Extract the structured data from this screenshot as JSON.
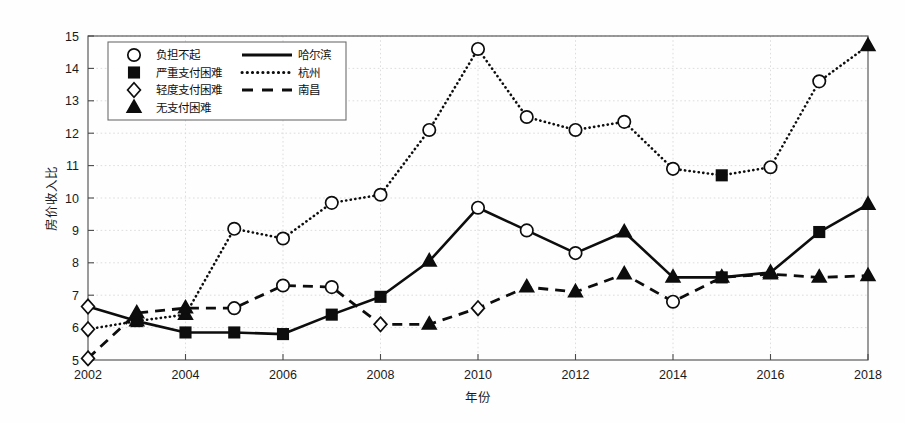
{
  "chart_data": {
    "type": "line",
    "title": "",
    "xlabel": "年份",
    "ylabel": "房价收入比",
    "xlim": [
      2002,
      2018
    ],
    "ylim": [
      5,
      15
    ],
    "x": [
      2002,
      2003,
      2004,
      2005,
      2006,
      2007,
      2008,
      2009,
      2010,
      2011,
      2012,
      2013,
      2014,
      2015,
      2016,
      2017,
      2018
    ],
    "xticks": [
      "2002",
      "2004",
      "2006",
      "2008",
      "2010",
      "2012",
      "2014",
      "2016",
      "2018"
    ],
    "yticks": [
      "5",
      "6",
      "7",
      "8",
      "9",
      "10",
      "11",
      "12",
      "13",
      "14",
      "15"
    ],
    "grid": true,
    "legend_position": "upper-left",
    "series": [
      {
        "name": "哈尔滨",
        "style": "solid",
        "values": [
          6.65,
          6.2,
          5.85,
          5.85,
          5.8,
          6.4,
          6.95,
          8.05,
          9.7,
          9.0,
          8.3,
          8.95,
          7.55,
          7.55,
          7.7,
          8.95,
          9.8
        ],
        "markers": [
          "轻度支付困难",
          "严重支付困难",
          "严重支付困难",
          "严重支付困难",
          "严重支付困难",
          "严重支付困难",
          "严重支付困难",
          "无支付困难",
          "负担不起",
          "负担不起",
          "负担不起",
          "无支付困难",
          "无支付困难",
          "严重支付困难",
          "无支付困难",
          "严重支付困难",
          "无支付困难"
        ]
      },
      {
        "name": "杭州",
        "style": "dotted",
        "values": [
          5.95,
          6.2,
          6.4,
          9.05,
          8.75,
          9.85,
          10.1,
          12.1,
          14.6,
          12.5,
          12.1,
          12.35,
          10.9,
          10.7,
          10.95,
          13.6,
          14.7
        ],
        "markers": [
          "轻度支付困难",
          "无支付困难",
          "无支付困难",
          "负担不起",
          "负担不起",
          "负担不起",
          "负担不起",
          "负担不起",
          "负担不起",
          "负担不起",
          "负担不起",
          "负担不起",
          "负担不起",
          "严重支付困难",
          "负担不起",
          "负担不起",
          "无支付困难"
        ]
      },
      {
        "name": "南昌",
        "style": "dashed",
        "values": [
          5.05,
          6.45,
          6.6,
          6.6,
          7.3,
          7.25,
          6.1,
          6.1,
          6.6,
          7.25,
          7.1,
          7.65,
          6.8,
          7.55,
          7.65,
          7.55,
          7.6
        ],
        "markers": [
          "轻度支付困难",
          "无支付困难",
          "无支付困难",
          "负担不起",
          "负担不起",
          "负担不起",
          "轻度支付困难",
          "无支付困难",
          "轻度支付困难",
          "无支付困难",
          "无支付困难",
          "无支付困难",
          "负担不起",
          "无支付困难",
          "无支付困难",
          "无支付困难",
          "无支付困难"
        ]
      }
    ]
  },
  "legend": {
    "marker_entries": [
      {
        "label": "负担不起",
        "marker": "circle-open"
      },
      {
        "label": "严重支付困难",
        "marker": "square-solid"
      },
      {
        "label": "轻度支付困难",
        "marker": "diamond-open"
      },
      {
        "label": "无支付困难",
        "marker": "triangle-solid"
      }
    ],
    "line_entries": [
      {
        "label": "哈尔滨",
        "style": "solid"
      },
      {
        "label": "杭州",
        "style": "dotted"
      },
      {
        "label": "南昌",
        "style": "dashed"
      }
    ]
  },
  "colors": {
    "ink": "#0d0d0d",
    "axis": "#4a4a4a",
    "grid": "#d9d9d9",
    "background": "#fefefe"
  }
}
